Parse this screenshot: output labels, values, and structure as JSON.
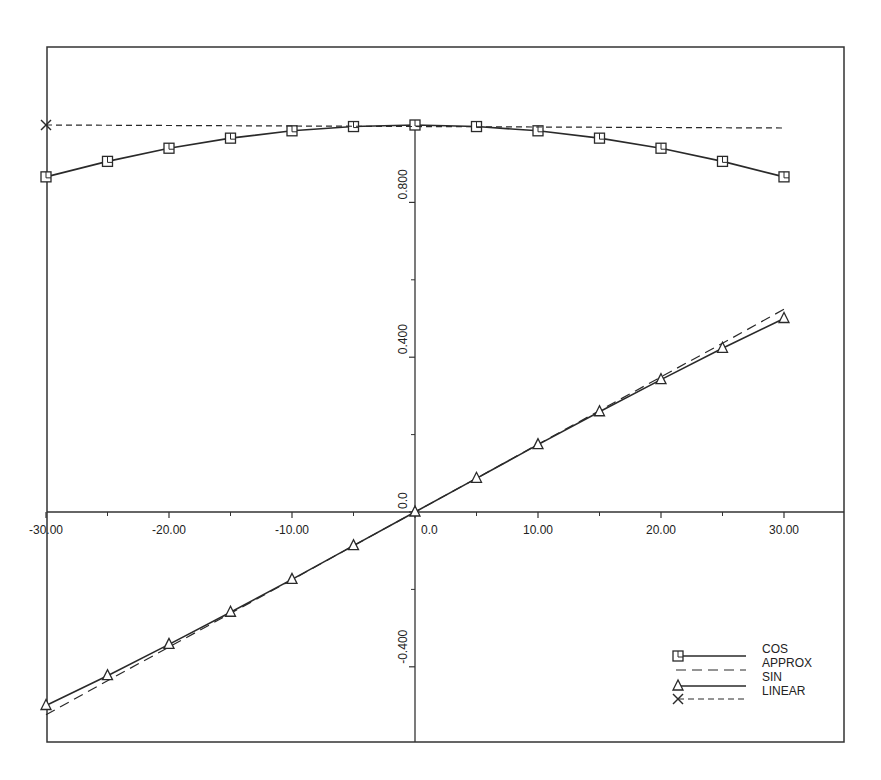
{
  "chart_data": {
    "type": "line",
    "title": "",
    "xlabel": "",
    "ylabel": "",
    "xlim": [
      -30,
      30
    ],
    "ylim": [
      -0.6,
      1.2
    ],
    "grid": false,
    "legend_position": "lower right",
    "x_ticks": [
      {
        "value": -30,
        "label": "-30.00"
      },
      {
        "value": -20,
        "label": "-20.00"
      },
      {
        "value": -10,
        "label": "-10.00"
      },
      {
        "value": 0,
        "label": "0.0"
      },
      {
        "value": 10,
        "label": "10.00"
      },
      {
        "value": 20,
        "label": "20.00"
      },
      {
        "value": 30,
        "label": "30.00"
      }
    ],
    "x_minor_ticks": [
      -25,
      -15,
      -5,
      5,
      15,
      25
    ],
    "y_ticks": [
      {
        "value": -0.4,
        "label": "-0.400"
      },
      {
        "value": 0.0,
        "label": "0.0"
      },
      {
        "value": 0.4,
        "label": "0.400"
      },
      {
        "value": 0.8,
        "label": "0.800"
      }
    ],
    "y_minor_ticks": [
      -0.2,
      0.2,
      0.6
    ],
    "x": [
      -30,
      -25,
      -20,
      -15,
      -10,
      -5,
      0,
      5,
      10,
      15,
      20,
      25,
      30
    ],
    "series": [
      {
        "name": "COS",
        "style": "solid",
        "marker": "square",
        "values": [
          0.866,
          0.906,
          0.94,
          0.966,
          0.985,
          0.996,
          1.0,
          0.996,
          0.985,
          0.966,
          0.94,
          0.906,
          0.866
        ]
      },
      {
        "name": "APPROX",
        "style": "dashed",
        "marker": "none",
        "values": [
          -0.524,
          -0.436,
          -0.349,
          -0.262,
          -0.175,
          -0.087,
          0.0,
          0.087,
          0.175,
          0.262,
          0.349,
          0.436,
          0.524
        ]
      },
      {
        "name": "SIN",
        "style": "solid",
        "marker": "triangle",
        "values": [
          -0.5,
          -0.423,
          -0.342,
          -0.259,
          -0.174,
          -0.087,
          0.0,
          0.087,
          0.174,
          0.259,
          0.342,
          0.423,
          0.5
        ]
      },
      {
        "name": "LINEAR",
        "style": "short-dashed",
        "marker": "x",
        "values": [
          1.0,
          1.0,
          1.0,
          1.0,
          1.0,
          1.0,
          1.0,
          1.0,
          1.0,
          1.0,
          1.0,
          1.0,
          1.0
        ]
      }
    ]
  },
  "legend": {
    "items": [
      {
        "label": "COS"
      },
      {
        "label": "APPROX"
      },
      {
        "label": "SIN"
      },
      {
        "label": "LINEAR"
      }
    ]
  },
  "colors": {
    "line": "#2a2a2a",
    "frame": "#333333",
    "background": "#ffffff"
  }
}
